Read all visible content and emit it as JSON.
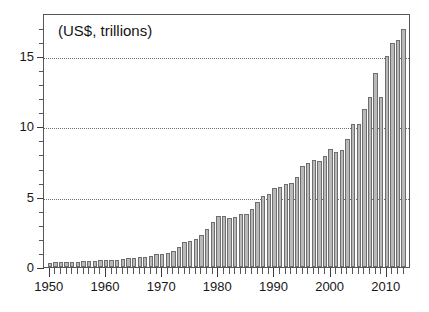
{
  "chart_data": {
    "type": "bar",
    "title": "",
    "subtitle": "",
    "annotation": "(US$, trillions)",
    "xlabel": "",
    "ylabel": "",
    "units": "US$, trillions",
    "grid": true,
    "legend": "none",
    "xlim": [
      1949,
      2014
    ],
    "ylim": [
      0,
      18
    ],
    "ytick_labels": [
      "0",
      "5",
      "10",
      "15"
    ],
    "ytick_values": [
      0,
      5,
      10,
      15
    ],
    "yminor_step": 1,
    "xtick_labels": [
      "1950",
      "1960",
      "1970",
      "1980",
      "1990",
      "2000",
      "2010"
    ],
    "xtick_values": [
      1950,
      1960,
      1970,
      1980,
      1990,
      2000,
      2010
    ],
    "xminor_step": 1,
    "bar_color": "#b9b9b9",
    "bar_edge_color": "#6e6e6e",
    "axis_color": "#55555a",
    "grid_color": "#6b6b70",
    "categories": [
      1950,
      1951,
      1952,
      1953,
      1954,
      1955,
      1956,
      1957,
      1958,
      1959,
      1960,
      1961,
      1962,
      1963,
      1964,
      1965,
      1966,
      1967,
      1968,
      1969,
      1970,
      1971,
      1972,
      1973,
      1974,
      1975,
      1976,
      1977,
      1978,
      1979,
      1980,
      1981,
      1982,
      1983,
      1984,
      1985,
      1986,
      1987,
      1988,
      1989,
      1990,
      1991,
      1992,
      1993,
      1994,
      1995,
      1996,
      1997,
      1998,
      1999,
      2000,
      2001,
      2002,
      2003,
      2004,
      2005,
      2006,
      2007,
      2008,
      2009,
      2010,
      2011,
      2012,
      2013
    ],
    "values": [
      0.3,
      0.34,
      0.36,
      0.37,
      0.36,
      0.39,
      0.43,
      0.46,
      0.44,
      0.48,
      0.5,
      0.51,
      0.54,
      0.57,
      0.63,
      0.68,
      0.74,
      0.76,
      0.83,
      0.92,
      0.95,
      1.02,
      1.18,
      1.5,
      1.85,
      1.9,
      2.1,
      2.35,
      2.85,
      3.4,
      3.95,
      4.0,
      3.8,
      3.8,
      4.0,
      4.05,
      4.35,
      4.95,
      5.45,
      5.65,
      6.25,
      6.3,
      6.6,
      6.65,
      7.3,
      8.5,
      8.9,
      9.3,
      9.25,
      9.8,
      10.7,
      10.35,
      10.65,
      12.0,
      14.0,
      15.7,
      17.5,
      19.7,
      20.5,
      16.1,
      19.1,
      22.2,
      22.7,
      23.5
    ],
    "values_plotted": [
      0.3,
      0.33,
      0.35,
      0.36,
      0.36,
      0.38,
      0.42,
      0.45,
      0.43,
      0.47,
      0.49,
      0.5,
      0.53,
      0.56,
      0.62,
      0.66,
      0.72,
      0.74,
      0.81,
      0.89,
      0.92,
      0.99,
      1.14,
      1.45,
      1.75,
      1.82,
      2.0,
      2.25,
      2.7,
      3.2,
      3.6,
      3.65,
      3.5,
      3.55,
      3.75,
      3.8,
      4.1,
      4.6,
      5.05,
      5.2,
      5.6,
      5.7,
      5.9,
      5.95,
      6.4,
      7.2,
      7.4,
      7.6,
      7.5,
      7.9,
      8.4,
      8.2,
      8.35,
      9.1,
      10.2,
      10.2,
      11.2,
      12.1,
      13.8,
      12.05,
      15.0,
      15.9,
      16.1,
      16.9
    ]
  },
  "figure": {
    "background": "#ffffff",
    "width": 429,
    "height": 312
  }
}
